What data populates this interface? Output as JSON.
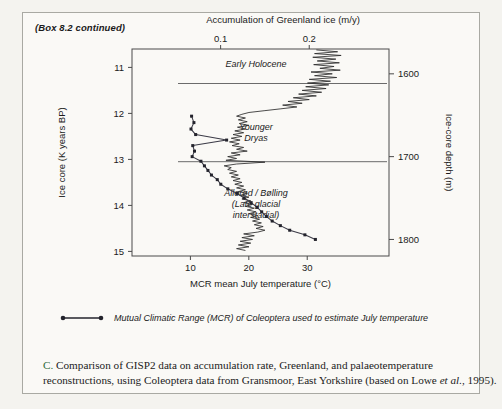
{
  "box": {
    "continued_label": "(Box 8.2 continued)"
  },
  "chart_data": {
    "type": "line",
    "title": "Accumulation of Greenland ice (m/y)",
    "top_axis": {
      "label": "Accumulation of Greenland ice (m/y)",
      "ticks": [
        0.1,
        0.2
      ],
      "tick_labels": [
        "0.1",
        "0.2"
      ],
      "range": [
        0.0,
        0.29
      ]
    },
    "bottom_axis": {
      "label": "MCR mean July temperature (°C)",
      "ticks": [
        10,
        20,
        30
      ],
      "tick_labels": [
        "10",
        "20",
        "30"
      ],
      "range": [
        0,
        44
      ]
    },
    "left_axis": {
      "label": "Ice core (K years BP)",
      "ticks": [
        11,
        12,
        13,
        14,
        15
      ],
      "tick_labels": [
        "11",
        "12",
        "13",
        "14",
        "15"
      ],
      "range": [
        10.6,
        15.1
      ]
    },
    "right_axis": {
      "label": "Ice-core depth (m)",
      "ticks": [
        1600,
        1700,
        1800
      ],
      "tick_labels": [
        "1600",
        "1700",
        "1800"
      ],
      "range": [
        1570,
        1820
      ]
    },
    "grid": false,
    "legend_position": "below-plot",
    "series": [
      {
        "name": "GISP2 accumulation of Greenland ice",
        "axis": "top",
        "unit": "m/y",
        "points_y_age": [
          10.62,
          10.66,
          10.7,
          10.74,
          10.78,
          10.82,
          10.86,
          10.9,
          10.94,
          10.98,
          11.02,
          11.06,
          11.1,
          11.14,
          11.18,
          11.22,
          11.26,
          11.3,
          11.34,
          11.38,
          11.42,
          11.46,
          11.5,
          11.54,
          11.58,
          11.62,
          11.66,
          11.7,
          11.74,
          11.78,
          11.82,
          11.86,
          11.9,
          11.94,
          11.98,
          12.02,
          12.06,
          12.1,
          12.14,
          12.18,
          12.22,
          12.26,
          12.3,
          12.34,
          12.38,
          12.42,
          12.46,
          12.5,
          12.54,
          12.58,
          12.62,
          12.66,
          12.7,
          12.74,
          12.78,
          12.82,
          12.86,
          12.9,
          12.94,
          12.98,
          13.02,
          13.06,
          13.1,
          13.14,
          13.18,
          13.22,
          13.26,
          13.3,
          13.34,
          13.38,
          13.42,
          13.46,
          13.5,
          13.54,
          13.58,
          13.62,
          13.66,
          13.7,
          13.74,
          13.78,
          13.82,
          13.86,
          13.9,
          13.94,
          13.98,
          14.02,
          14.06,
          14.1,
          14.14,
          14.18,
          14.22,
          14.26,
          14.3,
          14.34,
          14.38,
          14.42,
          14.46,
          14.5,
          14.54,
          14.58,
          14.62,
          14.66,
          14.7,
          14.74,
          14.78,
          14.82,
          14.86,
          14.9,
          14.94,
          14.98
        ],
        "points_x_value": [
          0.208,
          0.232,
          0.206,
          0.236,
          0.204,
          0.23,
          0.209,
          0.234,
          0.205,
          0.228,
          0.212,
          0.235,
          0.202,
          0.226,
          0.206,
          0.231,
          0.2,
          0.224,
          0.198,
          0.222,
          0.196,
          0.219,
          0.192,
          0.214,
          0.188,
          0.208,
          0.182,
          0.2,
          0.176,
          0.192,
          0.17,
          0.186,
          0.168,
          0.15,
          0.132,
          0.124,
          0.118,
          0.128,
          0.12,
          0.13,
          0.121,
          0.132,
          0.119,
          0.128,
          0.116,
          0.126,
          0.114,
          0.124,
          0.112,
          0.122,
          0.11,
          0.121,
          0.113,
          0.126,
          0.118,
          0.13,
          0.112,
          0.122,
          0.108,
          0.118,
          0.106,
          0.15,
          0.118,
          0.104,
          0.112,
          0.108,
          0.118,
          0.11,
          0.12,
          0.112,
          0.122,
          0.114,
          0.124,
          0.116,
          0.126,
          0.118,
          0.128,
          0.12,
          0.13,
          0.122,
          0.132,
          0.124,
          0.134,
          0.126,
          0.136,
          0.128,
          0.138,
          0.13,
          0.14,
          0.132,
          0.142,
          0.134,
          0.144,
          0.136,
          0.146,
          0.138,
          0.148,
          0.14,
          0.15,
          0.142,
          0.126,
          0.138,
          0.124,
          0.136,
          0.122,
          0.134,
          0.12,
          0.132,
          0.118,
          0.128
        ]
      },
      {
        "name": "Mutual Climatic Range (MCR) of Coleoptera",
        "axis": "bottom",
        "unit": "°C",
        "points_y_age": [
          12.06,
          12.2,
          12.34,
          12.46,
          12.58,
          12.7,
          12.82,
          12.94,
          13.04,
          13.14,
          13.24,
          13.34,
          13.44,
          13.54,
          13.64,
          13.74,
          13.84,
          13.94,
          14.04,
          14.14,
          14.24,
          14.34,
          14.44,
          14.54,
          14.64,
          14.74
        ],
        "points_x_value": [
          10.2,
          10.6,
          10.1,
          10.9,
          16.2,
          10.4,
          10.7,
          10.3,
          11.8,
          12.4,
          13.0,
          13.6,
          14.6,
          15.2,
          16.4,
          18.0,
          19.2,
          20.4,
          21.4,
          22.2,
          23.0,
          24.0,
          25.4,
          27.0,
          29.6,
          31.4
        ]
      }
    ],
    "annotations": [
      {
        "text": "Early Holocene",
        "lines": [
          "Early Holocene"
        ],
        "at_age": 11.0
      },
      {
        "text": "Younger Dryas",
        "lines": [
          "Younger",
          "Dryas"
        ],
        "at_age": 12.35
      },
      {
        "text": "Allerød / Bølling (Late glacial interstadial)",
        "lines": [
          "Allerød / Bølling",
          "(Late glacial",
          "interstadial)"
        ],
        "at_age": 13.8
      }
    ],
    "dividers_at_age": [
      11.35,
      13.05
    ]
  },
  "legend": {
    "entry_label": "Mutual Climatic Range (MCR) of Coleoptera used to estimate July temperature"
  },
  "caption": {
    "label": "C.",
    "line1": " Comparison of GISP2 data on accumulation rate, Greenland, and palaeotemperature",
    "line2": "reconstructions, using Coleoptera data from Gransmoor, East Yorkshire (based on",
    "line3_pre": "Lowe ",
    "line3_ital": "et al.",
    "line3_post": ", 1995)."
  },
  "colors": {
    "page_background": "#f4f3ef",
    "box_background": "#faf9f6",
    "box_border": "#a9a9a3",
    "axis": "#4a4a4a",
    "accumulation_series": "#2c2c2c",
    "mcr_series": "#3a3a46",
    "caption_label": "#2f6b3a"
  }
}
